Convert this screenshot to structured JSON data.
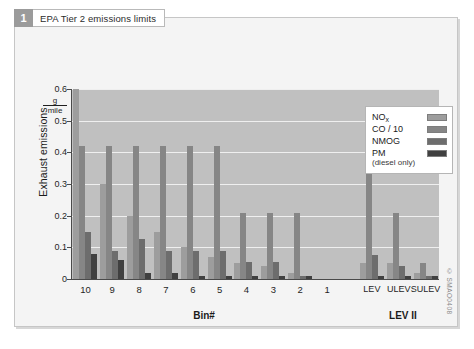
{
  "figure": {
    "number": "1",
    "caption": "EPA Tier 2 emissions limits",
    "watermark": "© SMAO0408"
  },
  "legend": {
    "position": "top-right",
    "entries": [
      {
        "label": "NO",
        "sub": "x",
        "color": "#9d9d9d",
        "series": "NOx"
      },
      {
        "label": "CO / 10",
        "sub": "",
        "color": "#868686",
        "series": "CO / 10"
      },
      {
        "label": "NMOG",
        "sub": "",
        "color": "#6d6d6d",
        "series": "NMOG"
      },
      {
        "label": "PM",
        "sub": "",
        "color": "#404040",
        "series": "PM"
      }
    ],
    "note": "(diesel only)"
  },
  "chart_data": {
    "type": "bar",
    "title": "EPA Tier 2 emissions limits",
    "xlabel": "Bin#",
    "xlabel2": "LEV II",
    "ylabel": "Exhaust emissions",
    "yunit_numerator": "g",
    "yunit_denominator": "mile",
    "ylim": [
      0,
      0.6
    ],
    "yticks": [
      0,
      0.1,
      0.2,
      0.3,
      0.4,
      0.5,
      0.6
    ],
    "ytick_labels": [
      "0",
      "0.1",
      "0.2",
      "0.3",
      "0.4",
      "0.5",
      "0.6"
    ],
    "grid": true,
    "categories": [
      "10",
      "9",
      "8",
      "7",
      "6",
      "5",
      "4",
      "3",
      "2",
      "1",
      "LEV",
      "ULEV",
      "SULEV"
    ],
    "group2_start_index": 10,
    "series": [
      {
        "name": "NOx",
        "color": "#9d9d9d",
        "values": [
          0.6,
          0.3,
          0.2,
          0.15,
          0.1,
          0.07,
          0.05,
          0.04,
          0.02,
          0.0,
          0.05,
          0.05,
          0.02
        ]
      },
      {
        "name": "CO / 10",
        "color": "#868686",
        "values": [
          0.42,
          0.42,
          0.42,
          0.42,
          0.42,
          0.42,
          0.21,
          0.21,
          0.21,
          0.0,
          0.42,
          0.21,
          0.05
        ]
      },
      {
        "name": "NMOG",
        "color": "#6d6d6d",
        "values": [
          0.15,
          0.09,
          0.125,
          0.09,
          0.09,
          0.09,
          0.055,
          0.055,
          0.01,
          0.0,
          0.075,
          0.04,
          0.01
        ]
      },
      {
        "name": "PM",
        "color": "#404040",
        "values": [
          0.08,
          0.06,
          0.02,
          0.02,
          0.01,
          0.01,
          0.01,
          0.01,
          0.01,
          0.0,
          0.01,
          0.01,
          0.01
        ]
      }
    ]
  }
}
